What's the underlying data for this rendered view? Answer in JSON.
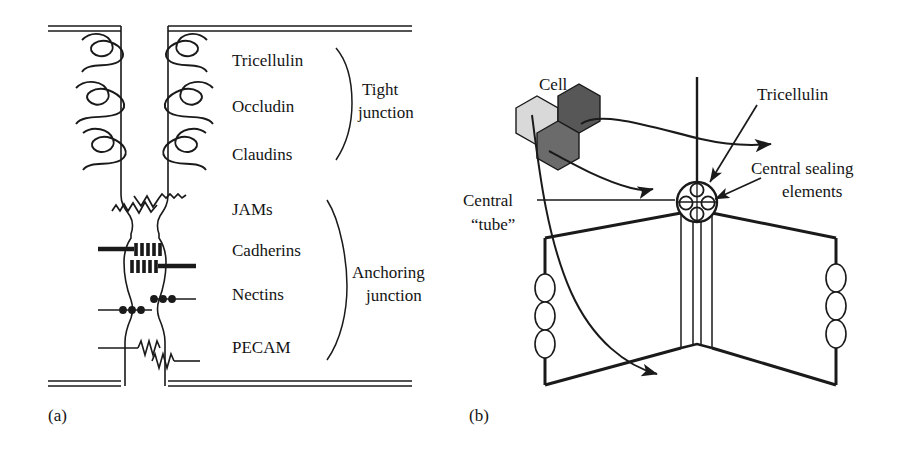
{
  "figure": {
    "kind": "scientific-diagram",
    "background_color": "#ffffff",
    "ink_color": "#1a1a1a"
  },
  "panel_a": {
    "tag": "(a)",
    "protein_labels": [
      {
        "name": "tricellulin",
        "text": "Tricellulin"
      },
      {
        "name": "occludin",
        "text": "Occludin"
      },
      {
        "name": "claudins",
        "text": "Claudins"
      },
      {
        "name": "jams",
        "text": "JAMs"
      },
      {
        "name": "cadherins",
        "text": "Cadherins"
      },
      {
        "name": "nectins",
        "text": "Nectins"
      },
      {
        "name": "pecam",
        "text": "PECAM"
      }
    ],
    "group_labels": [
      {
        "name": "tight-junction",
        "line1": "Tight",
        "line2": "junction"
      },
      {
        "name": "anchoring-junction",
        "line1": "Anchoring",
        "line2": "junction"
      }
    ]
  },
  "panel_b": {
    "tag": "(b)",
    "labels": [
      {
        "name": "cell",
        "line1": "Cell",
        "line2": ""
      },
      {
        "name": "tricellulin",
        "line1": "Tricellulin",
        "line2": ""
      },
      {
        "name": "central-sealing-elements",
        "line1": "Central sealing",
        "line2": "elements"
      },
      {
        "name": "central-tube",
        "line1": "Central",
        "line2": "“tube”"
      }
    ],
    "cells": [
      {
        "name": "cell-hex-light",
        "fill": "#d9d9d9"
      },
      {
        "name": "cell-hex-dark",
        "fill": "#575757"
      },
      {
        "name": "cell-hex-medium",
        "fill": "#6b6b6b"
      }
    ],
    "sealing_element_count": 4,
    "membrane_oval_count_per_edge": 3
  }
}
